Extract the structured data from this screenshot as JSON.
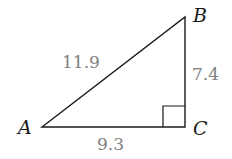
{
  "diagram": {
    "type": "right-triangle",
    "vertices": [
      {
        "id": "A",
        "label": "A",
        "x": 42,
        "y": 127
      },
      {
        "id": "B",
        "label": "B",
        "x": 185,
        "y": 17
      },
      {
        "id": "C",
        "label": "C",
        "x": 185,
        "y": 127
      }
    ],
    "sides": [
      {
        "id": "AB",
        "label": "11.9"
      },
      {
        "id": "BC",
        "label": "7.4"
      },
      {
        "id": "AC",
        "label": "9.3"
      }
    ],
    "right_angle_at": "C",
    "colors": {
      "lines": "#1a1a1a",
      "vertex_labels": "#1a1a1a",
      "side_labels": "#808080"
    }
  }
}
